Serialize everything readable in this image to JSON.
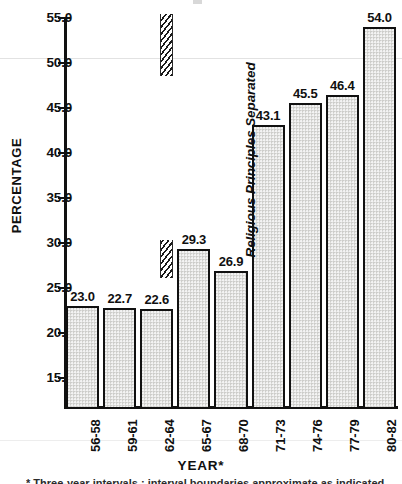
{
  "chart_data": {
    "type": "bar",
    "title": "",
    "subtitle": "",
    "xlabel": "YEAR*",
    "ylabel": "PERCENTAGE",
    "categories": [
      "56-58",
      "59-61",
      "62-64",
      "65-67",
      "68-70",
      "71-73",
      "74-76",
      "77-79",
      "80-82"
    ],
    "values": [
      23.0,
      22.7,
      22.6,
      29.3,
      26.9,
      43.1,
      45.5,
      46.4,
      54.0
    ],
    "value_labels": [
      "23.0",
      "22.7",
      "22.6",
      "29.3",
      "26.9",
      "43.1",
      "45.5",
      "46.4",
      "54.0"
    ],
    "ylim": [
      15.0,
      55.0
    ],
    "yticks": [
      15.0,
      20.0,
      25.0,
      30.0,
      35.0,
      40.0,
      45.0,
      50.0,
      55.0
    ],
    "ytick_labels": [
      "15.0",
      "20.0",
      "25.0",
      "30.0",
      "35.0",
      "40.0",
      "45.0",
      "50.0",
      "55.0"
    ],
    "grid": false,
    "legend": null,
    "annotations": [
      {
        "text": "Religious Principles Separated",
        "style": "bold-italic-rotated",
        "marker": "hatched-vertical-bar",
        "between_categories": [
          "62-64",
          "65-67"
        ]
      }
    ],
    "bar_fill": "#dededc",
    "bar_edge": "#111111",
    "axis_color": "#111111"
  },
  "axis": {
    "y_title": "PERCENTAGE",
    "x_title": "YEAR*"
  },
  "annotation": {
    "label": "Religious Principles Separated"
  },
  "footnote": {
    "text": "* Three-year intervals ; interval boundaries approximate as indicated in the source"
  }
}
